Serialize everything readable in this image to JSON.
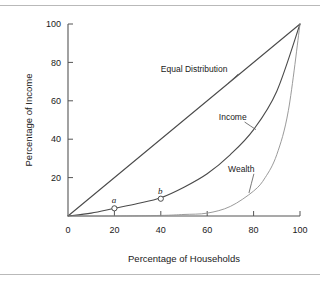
{
  "figure": {
    "name": "lorenz-curve-figure",
    "background": "#ffffff",
    "rule_color": "#b9b9b9"
  },
  "chart_data": {
    "type": "line",
    "title": "",
    "xlabel": "Percentage of Households",
    "ylabel": "Percentage of Income",
    "xlim": [
      0,
      100
    ],
    "ylim": [
      0,
      100
    ],
    "grid": false,
    "legend_position": "inline-annotations",
    "xticks": [
      0,
      20,
      40,
      60,
      80,
      100
    ],
    "xtick_labels": [
      "0",
      "20",
      "40",
      "60",
      "80",
      "100"
    ],
    "yticks": [
      20,
      40,
      60,
      80,
      100
    ],
    "ytick_labels": [
      "20",
      "40",
      "60",
      "80",
      "100"
    ],
    "series": [
      {
        "name": "Equal Distribution",
        "color": "#4a4a4a",
        "x": [
          0,
          100
        ],
        "values": [
          0,
          100
        ]
      },
      {
        "name": "Income",
        "color": "#4a4a4a",
        "x": [
          0,
          10,
          20,
          30,
          40,
          50,
          60,
          70,
          80,
          90,
          100
        ],
        "values": [
          0,
          1.5,
          4,
          6.5,
          9.5,
          15,
          22,
          32,
          45,
          65,
          100
        ]
      },
      {
        "name": "Wealth",
        "color": "#8e8e8e",
        "x": [
          0,
          20,
          40,
          50,
          60,
          70,
          80,
          85,
          90,
          95,
          100
        ],
        "values": [
          0,
          0,
          0.3,
          0.8,
          1.5,
          5,
          13,
          20,
          32,
          55,
          100
        ]
      }
    ],
    "annotations": [
      {
        "name": "Equal Distribution",
        "label": "Equal Distribution",
        "label_x": 40,
        "label_y": 75,
        "point_x": 69,
        "point_y": 69
      },
      {
        "name": "Income",
        "label": "Income",
        "label_x": 65,
        "label_y": 50,
        "point_x": 81,
        "point_y": 45
      },
      {
        "name": "Wealth",
        "label": "Wealth",
        "label_x": 69,
        "label_y": 23,
        "point_x": 78,
        "point_y": 12
      }
    ],
    "points": [
      {
        "name": "a",
        "label": "a",
        "x": 20,
        "y": 4
      },
      {
        "name": "b",
        "label": "b",
        "x": 40,
        "y": 9
      }
    ]
  }
}
